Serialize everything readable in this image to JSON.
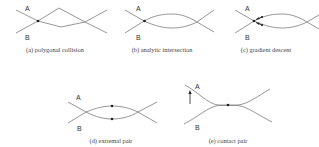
{
  "panels": [
    {
      "id": "a",
      "caption": "(a) polygonal collision",
      "curve_a_label": "A",
      "curve_b_label": "B"
    },
    {
      "id": "b",
      "caption": "(b) analytic intersection",
      "curve_a_label": "A",
      "curve_b_label": "B"
    },
    {
      "id": "c",
      "caption": "(c) gradient descent",
      "curve_a_label": "A",
      "curve_b_label": "B"
    },
    {
      "id": "d",
      "caption": "(d) extremal pair",
      "curve_a_label": "A",
      "curve_b_label": "B"
    },
    {
      "id": "e",
      "caption": "(e) contact pair",
      "curve_a_label": "A",
      "curve_b_label": "B"
    }
  ],
  "colors": {
    "curve": "#8a8a8a",
    "point": "#222222",
    "text": "#333333"
  }
}
